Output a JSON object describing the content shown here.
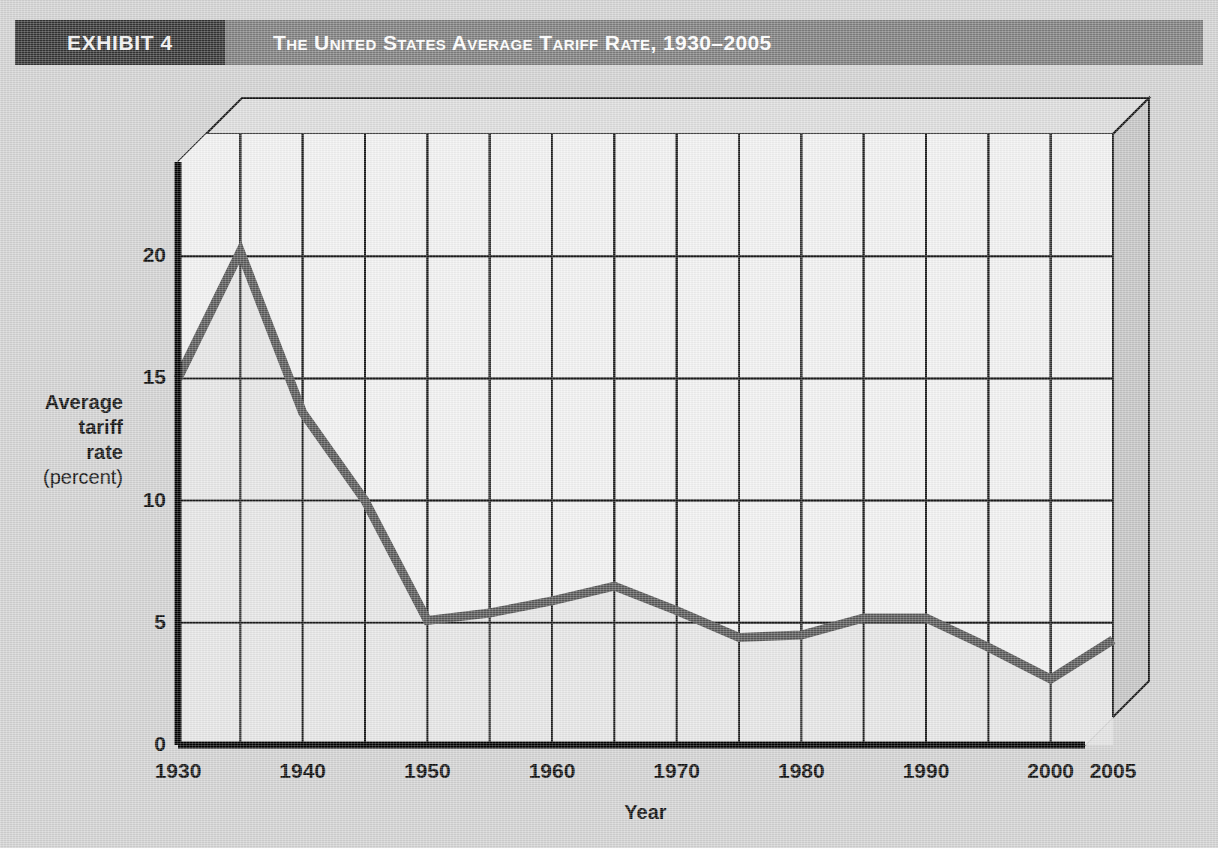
{
  "header": {
    "exhibit_label": "EXHIBIT 4",
    "title": "The United States Average Tariff Rate, 1930–2005"
  },
  "colors": {
    "page_background": "#d2d2d2",
    "header_band": "#7d7d7d",
    "header_tab": "#333333",
    "plot_background": "#f2f2f2",
    "grid": "#1a1a1a",
    "data_line": "#575757",
    "axis": "#000000",
    "bevel_face": "#c9c9c9"
  },
  "chart_data": {
    "type": "line",
    "title": "The United States Average Tariff Rate, 1930–2005",
    "xlabel": "Year",
    "ylabel": "Average tariff rate (percent)",
    "ylabel_lines": [
      "Average",
      "tariff",
      "rate"
    ],
    "ylabel_unit": "(percent)",
    "x": [
      1930,
      1935,
      1940,
      1945,
      1950,
      1955,
      1960,
      1965,
      1970,
      1975,
      1980,
      1985,
      1990,
      1995,
      2000,
      2005
    ],
    "values": [
      15.0,
      20.2,
      13.6,
      10.0,
      5.1,
      5.4,
      5.9,
      6.5,
      5.5,
      4.4,
      4.5,
      5.2,
      5.2,
      4.0,
      2.7,
      4.3
    ],
    "series": [
      {
        "name": "Average tariff rate",
        "values": [
          15.0,
          20.2,
          13.6,
          10.0,
          5.1,
          5.4,
          5.9,
          6.5,
          5.5,
          4.4,
          4.5,
          5.2,
          5.2,
          4.0,
          2.7,
          4.3
        ]
      }
    ],
    "xticks": [
      1930,
      1940,
      1950,
      1960,
      1970,
      1980,
      1990,
      2000,
      2005
    ],
    "xtick_labels": [
      "1930",
      "1940",
      "1950",
      "1960",
      "1970",
      "1980",
      "1990",
      "2000",
      "2005"
    ],
    "yticks": [
      0,
      5,
      10,
      15,
      20
    ],
    "ytick_labels": [
      "0",
      "5",
      "10",
      "15",
      "20"
    ],
    "xlim": [
      1930,
      2005
    ],
    "ylim": [
      0,
      25
    ],
    "grid": true,
    "grid_x_step": 5,
    "grid_y_step": 5,
    "legend": "none"
  }
}
